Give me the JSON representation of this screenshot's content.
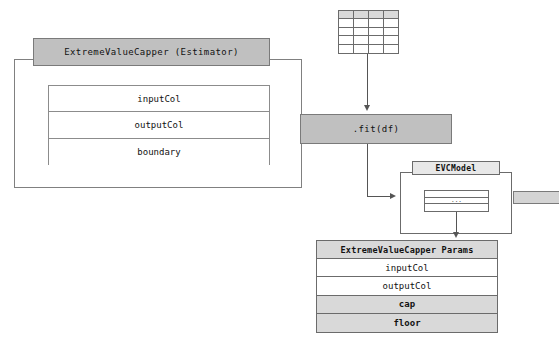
{
  "diagram": {
    "colors": {
      "shaded_bar": "#c0c0c0",
      "shaded_row": "#d9d9d9",
      "border": "#6b6b6b",
      "connector": "#555555",
      "background": "#ffffff"
    }
  },
  "estimator": {
    "header_label": "ExtremeValueCapper (Estimator)",
    "fields": [
      {
        "label": "inputCol"
      },
      {
        "label": "outputCol"
      },
      {
        "label": "boundary"
      }
    ]
  },
  "dataframe_glyph": {
    "name": "dataframe-table-icon",
    "columns": 4,
    "rows": 5,
    "header_shaded": true
  },
  "fit_call": {
    "label": ".fit(df)"
  },
  "model": {
    "header_label": "EVCModel",
    "inner_rows": [
      "",
      "...",
      ""
    ],
    "inner_ellipsis": "..."
  },
  "params": {
    "header_label": "ExtremeValueCapper Params",
    "rows": [
      {
        "label": "inputCol",
        "shaded": false
      },
      {
        "label": "outputCol",
        "shaded": false
      },
      {
        "label": "cap",
        "shaded": true
      },
      {
        "label": "floor",
        "shaded": true
      }
    ]
  }
}
